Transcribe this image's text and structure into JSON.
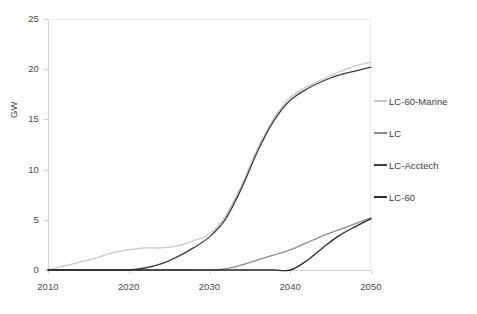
{
  "chart_data": {
    "type": "line",
    "title": "",
    "xlabel": "",
    "ylabel": "GW",
    "xlim": [
      2010,
      2050
    ],
    "ylim": [
      0,
      25
    ],
    "grid": false,
    "legend_position": "right",
    "x_ticks": [
      "2010",
      "2020",
      "2030",
      "2040",
      "2050"
    ],
    "y_ticks": [
      "0",
      "5",
      "10",
      "15",
      "20",
      "25"
    ],
    "x": [
      2010,
      2012,
      2014,
      2016,
      2018,
      2020,
      2022,
      2024,
      2026,
      2028,
      2030,
      2032,
      2034,
      2036,
      2038,
      2040,
      2042,
      2044,
      2046,
      2048,
      2050
    ],
    "series": [
      {
        "name": "LC-60-Marine",
        "color": "#c9c9c9",
        "values": [
          0,
          0.4,
          0.8,
          1.2,
          1.7,
          2.0,
          2.2,
          2.2,
          2.4,
          2.9,
          3.6,
          5.4,
          8.5,
          12.2,
          15.1,
          17.2,
          18.2,
          19.0,
          19.7,
          20.3,
          20.7
        ]
      },
      {
        "name": "LC",
        "color": "#8c8c8c",
        "values": [
          0,
          0,
          0,
          0,
          0,
          0,
          0,
          0,
          0,
          0,
          0,
          0.1,
          0.5,
          1.0,
          1.5,
          2.0,
          2.7,
          3.4,
          4.0,
          4.6,
          5.2
        ]
      },
      {
        "name": "LC-Acctech",
        "color": "#3d3d3d",
        "values": [
          0,
          0,
          0,
          0,
          0,
          0,
          0.2,
          0.6,
          1.3,
          2.2,
          3.3,
          5.1,
          8.2,
          11.9,
          14.9,
          16.9,
          18.0,
          18.8,
          19.4,
          19.8,
          20.2
        ]
      },
      {
        "name": "LC-60",
        "color": "#2b2b2b",
        "values": [
          0,
          0,
          0,
          0,
          0,
          0,
          0,
          0,
          0,
          0,
          0,
          0,
          0,
          0,
          0,
          0,
          0.9,
          2.2,
          3.4,
          4.3,
          5.1
        ]
      }
    ]
  },
  "axis": {
    "y_title": "GW"
  },
  "legend": {
    "items": [
      {
        "label": "LC-60-Marine",
        "color": "#c9c9c9"
      },
      {
        "label": "LC",
        "color": "#8c8c8c"
      },
      {
        "label": "LC-Acctech",
        "color": "#3d3d3d"
      },
      {
        "label": "LC-60",
        "color": "#2b2b2b"
      }
    ]
  },
  "colors": {
    "axis_line": "#d0d0d0",
    "tick_text": "#4a4a4a",
    "plot_background": "#ffffff"
  }
}
